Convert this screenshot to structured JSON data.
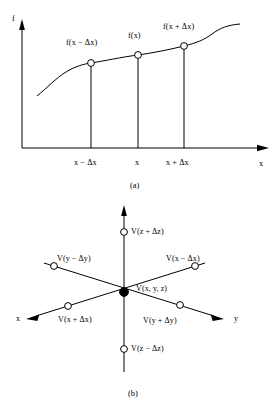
{
  "figure": {
    "type": "two-panel-diagram",
    "panel_a": {
      "caption": "(a)",
      "y_axis_label": "f",
      "x_axis_label": "x",
      "curve_point_labels": [
        "f(x − Δx)",
        "f(x)",
        "f(x + Δx)"
      ],
      "x_tick_labels": [
        "x − Δx",
        "x",
        "x + Δx"
      ],
      "description": "Monotonically increasing curve f versus x with three marked sample points at x−Δx, x, and x+Δx, each joined to the x-axis by a vertical drop line.",
      "chart_geometry": {
        "origin": [
          22,
          148
        ],
        "y_axis_top": [
          22,
          22
        ],
        "x_axis_right": [
          268,
          148
        ],
        "sample_x_pixels": [
          91,
          138,
          184
        ],
        "sample_y_pixels": [
          63,
          55,
          46
        ]
      }
    },
    "panel_b": {
      "caption": "(b)",
      "axis_labels": {
        "x": "x",
        "y": "y"
      },
      "center_label": "V(x, y, z)",
      "node_labels": {
        "z_plus": "V(z + Δz)",
        "z_minus": "V(z − Δz)",
        "x_minus": "V(x − Δx)",
        "x_plus": "V(x + Δx)",
        "y_minus": "V(y − Δy)",
        "y_plus": "V(y + Δy)"
      },
      "description": "Three-dimensional finite-difference stencil: a filled node V(x, y, z) at the origin with six open neighbour nodes along the ±x, ±y and ±z directions.",
      "chart_geometry": {
        "origin": [
          124,
          293
        ],
        "z_axis_tip": [
          124,
          207
        ],
        "z_plus_node": [
          124,
          232
        ],
        "z_minus_node": [
          124,
          349
        ],
        "x_axis_tip": [
          28,
          318
        ],
        "y_axis_tip": [
          224,
          318
        ],
        "x_minus_node": [
          195,
          268
        ],
        "x_plus_node": [
          68,
          310
        ],
        "y_minus_node": [
          54,
          268
        ],
        "y_plus_node": [
          180,
          311
        ]
      }
    },
    "colors": {
      "stroke": "#000000",
      "node_fill_open": "#ffffff",
      "node_fill_solid": "#000000",
      "background": "#ffffff"
    }
  }
}
